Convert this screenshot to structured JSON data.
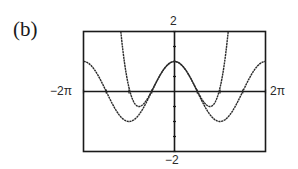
{
  "panel": {
    "label": "(b)"
  },
  "window": {
    "ymax_label": "2",
    "ymin_label": "−2",
    "xmin_label": "−2π",
    "xmax_label": "2π"
  },
  "chart_data": {
    "type": "line",
    "title": "(b)",
    "xlabel": "",
    "ylabel": "",
    "xlim": [
      -6.2832,
      6.2832
    ],
    "ylim": [
      -2,
      2
    ],
    "x_tick_labels": [
      "−2π",
      "2π"
    ],
    "y_tick_labels": [
      "−2",
      "2"
    ],
    "grid": false,
    "legend": null,
    "series": [
      {
        "name": "f(x) = cos x",
        "x": [
          -6.28,
          -4.71,
          -3.14,
          -1.57,
          0,
          1.57,
          3.14,
          4.71,
          6.28
        ],
        "values": [
          1,
          0,
          -1,
          0,
          1,
          0,
          -1,
          0,
          1
        ]
      },
      {
        "name": "P4(x) = 1 - x^2/2 + x^4/24",
        "x": [
          -3.7,
          -3.0,
          -2.45,
          -2.0,
          -1.0,
          0,
          1.0,
          2.0,
          2.45,
          3.0,
          3.7
        ],
        "values": [
          1.91,
          -0.13,
          -0.5,
          -0.33,
          0.54,
          1,
          0.54,
          -0.33,
          -0.5,
          -0.13,
          1.91
        ]
      }
    ],
    "frame": {
      "x_tick_step": 1.5708,
      "y_tick_step": 0.5
    }
  }
}
